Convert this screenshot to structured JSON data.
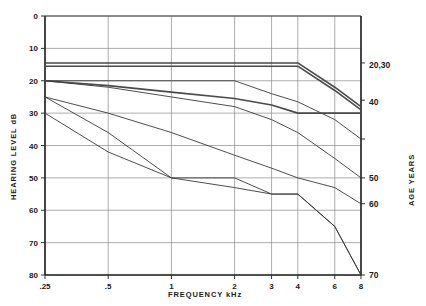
{
  "chart_data": {
    "type": "line",
    "title": "",
    "xlabel": "FREQUENCY  kHz",
    "ylabel": "HEARING  LEVEL   dB",
    "legend_title": "AGE  YEARS",
    "legend_position": "right-axis",
    "grid": true,
    "x_scale": "log",
    "x_ticks": [
      ".25",
      ".5",
      "1",
      "2",
      "3",
      "4",
      "6",
      "8"
    ],
    "x_tick_values": [
      0.25,
      0.5,
      1,
      2,
      3,
      4,
      6,
      8
    ],
    "xlim": [
      0.25,
      8
    ],
    "y_ticks": [
      "0",
      "10",
      "20",
      "30",
      "40",
      "50",
      "60",
      "70",
      "80"
    ],
    "y_tick_values": [
      0,
      10,
      20,
      30,
      40,
      50,
      60,
      70,
      80
    ],
    "ylim": [
      0,
      80
    ],
    "y_inverted": true,
    "right_labels": [
      "20,30",
      "40",
      "50",
      "60",
      "70"
    ],
    "series": [
      {
        "name": "20,30",
        "label": "20,30",
        "emphasis": "bold",
        "x": [
          0.25,
          0.5,
          1,
          2,
          3,
          4,
          6,
          8
        ],
        "values": [
          14.5,
          14.5,
          14.5,
          14.5,
          14.5,
          14.5,
          22,
          28
        ]
      },
      {
        "name": "20,30b",
        "label": "",
        "emphasis": "bold",
        "x": [
          0.25,
          0.5,
          1,
          2,
          3,
          4,
          6,
          8
        ],
        "values": [
          15.5,
          15.5,
          15.5,
          15.5,
          15.5,
          15.5,
          23,
          29
        ]
      },
      {
        "name": "40",
        "label": "40",
        "emphasis": "normal",
        "x": [
          0.25,
          0.5,
          1,
          2,
          3,
          4,
          6,
          8
        ],
        "values": [
          20,
          20,
          20,
          20,
          24,
          26.5,
          32,
          38
        ]
      },
      {
        "name": "40b",
        "label": "",
        "emphasis": "bold",
        "x": [
          0.25,
          0.5,
          1,
          2,
          3,
          4,
          6,
          8
        ],
        "values": [
          20,
          21.5,
          23.5,
          25.5,
          27.5,
          30,
          30,
          30
        ]
      },
      {
        "name": "50",
        "label": "50",
        "emphasis": "normal",
        "x": [
          0.25,
          0.5,
          1,
          2,
          3,
          4,
          6,
          8
        ],
        "values": [
          20,
          22,
          25,
          28,
          32,
          36,
          44,
          50
        ]
      },
      {
        "name": "60",
        "label": "60",
        "emphasis": "normal",
        "x": [
          0.25,
          0.5,
          1,
          2,
          3,
          4,
          6,
          8
        ],
        "values": [
          25,
          30,
          36,
          43,
          47,
          50,
          53,
          58
        ]
      },
      {
        "name": "70",
        "label": "70",
        "emphasis": "normal",
        "x": [
          0.25,
          0.5,
          1,
          2,
          3,
          4,
          6,
          8
        ],
        "values": [
          25,
          36,
          50,
          50,
          55,
          55,
          65,
          80
        ]
      },
      {
        "name": "70b",
        "label": "",
        "emphasis": "normal",
        "x": [
          0.25,
          0.5,
          1,
          2,
          3,
          4,
          6,
          8
        ],
        "values": [
          30,
          42,
          50,
          53,
          55,
          55,
          65,
          80
        ]
      }
    ]
  },
  "axes": {
    "y_label": "HEARING  LEVEL   dB",
    "x_label": "FREQUENCY  kHz",
    "right_label": "AGE  YEARS"
  },
  "y_tick_labels": [
    "0",
    "10",
    "20",
    "30",
    "40",
    "50",
    "60",
    "70",
    "80"
  ],
  "x_tick_labels": [
    ".25",
    ".5",
    "1",
    "2",
    "3",
    "4",
    "6",
    "8"
  ],
  "right_tick_labels": [
    "20,30",
    "40",
    "50",
    "60",
    "70"
  ]
}
